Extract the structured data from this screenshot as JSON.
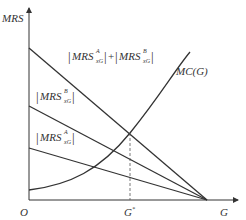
{
  "diagram": {
    "type": "economics-public-good-equilibrium",
    "axes": {
      "y_label": "MRS",
      "x_label": "G",
      "origin_label": "O",
      "equilibrium_tick_label": "G*"
    },
    "curves": [
      {
        "id": "sum",
        "label_main": "MRS",
        "label_sup_a": "A",
        "label_sub_a": "xG",
        "label_plus": "+",
        "label_sup_b": "B",
        "label_sub_b": "xG",
        "description": "|MRS^A_xG| + |MRS^B_xG|"
      },
      {
        "id": "b",
        "label_main": "MRS",
        "label_sup": "B",
        "label_sub": "xG",
        "description": "|MRS^B_xG|"
      },
      {
        "id": "a",
        "label_main": "MRS",
        "label_sup": "A",
        "label_sub": "xG",
        "description": "|MRS^A_xG|"
      },
      {
        "id": "mc",
        "label": "MC(G)",
        "description": "Marginal cost curve"
      }
    ],
    "colors": {
      "line": "#333333",
      "dashed": "#555555"
    }
  }
}
